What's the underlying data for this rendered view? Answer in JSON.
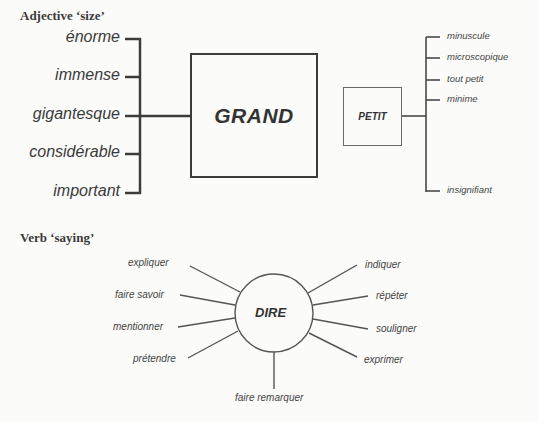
{
  "adjective_section": {
    "title": "Adjective ‘size’",
    "center_word": "GRAND",
    "synonyms": [
      "énorme",
      "immense",
      "gigantesque",
      "considérable",
      "important"
    ],
    "opposite": {
      "center_word": "PETIT",
      "synonyms": [
        "minuscule",
        "microscopique",
        "tout petit",
        "minime",
        "insignifiant"
      ]
    }
  },
  "verb_section": {
    "title": "Verb ‘saying’",
    "center_word": "DIRE",
    "left_synonyms": [
      "expliquer",
      "faire savoir",
      "mentionner",
      "prétendre"
    ],
    "right_synonyms": [
      "indiquer",
      "répéter",
      "souligner",
      "exprimer"
    ],
    "bottom_synonym": "faire remarquer"
  },
  "colors": {
    "line": "#3c3c3c",
    "background": "#fbfbf9"
  }
}
